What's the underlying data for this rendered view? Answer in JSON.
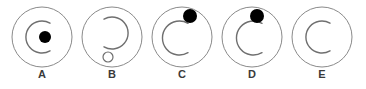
{
  "diagram": {
    "canvas": {
      "width": 366,
      "height": 89,
      "background": "#ffffff"
    },
    "style": {
      "outer_circle_stroke": "#8a8a8a",
      "outer_circle_stroke_width": 1,
      "inner_arc_stroke": "#6f6f6f",
      "inner_arc_stroke_width": 1.4,
      "dot_fill": "#000000",
      "small_circle_fill": "#ffffff",
      "small_circle_stroke": "#6f6f6f",
      "label_color": "#3a3a3a"
    },
    "layout": {
      "outer_diameter": 60,
      "spacing": 70,
      "first_center_x": 42,
      "center_y": 37,
      "label_y": 68
    },
    "figures": [
      {
        "id": "figure-a",
        "label": "A",
        "x": 7,
        "outer_circle": {
          "cx": 35,
          "cy": 37,
          "r": 30
        },
        "inner_arc": {
          "cx": 35,
          "cy": 37,
          "r": 16,
          "opening": "right",
          "path": "M 43 23.2 A 16 16 0 1 0 43 50.8"
        },
        "marker": {
          "type": "filled-dot",
          "cx": 38,
          "cy": 37,
          "r": 6
        }
      },
      {
        "id": "figure-b",
        "label": "B",
        "x": 77,
        "outer_circle": {
          "cx": 35,
          "cy": 37,
          "r": 30
        },
        "inner_arc": {
          "cx": 35,
          "cy": 33,
          "r": 16,
          "opening": "left",
          "path": "M 27 19.2 A 16 16 0 1 1 27 46.8"
        },
        "marker": {
          "type": "open-circle",
          "cx": 31,
          "cy": 57,
          "r": 5
        }
      },
      {
        "id": "figure-c",
        "label": "C",
        "x": 147,
        "outer_circle": {
          "cx": 35,
          "cy": 37,
          "r": 30
        },
        "inner_arc": {
          "cx": 33,
          "cy": 38,
          "r": 17,
          "opening": "right",
          "path": "M 41 23.3 A 17 17 0 1 0 41 52.7"
        },
        "marker": {
          "type": "filled-dot",
          "cx": 43,
          "cy": 16,
          "r": 7
        }
      },
      {
        "id": "figure-d",
        "label": "D",
        "x": 217,
        "outer_circle": {
          "cx": 35,
          "cy": 37,
          "r": 30
        },
        "inner_arc": {
          "cx": 37,
          "cy": 38,
          "r": 17,
          "opening": "right",
          "path": "M 45 23.3 A 17 17 0 1 0 45 52.7"
        },
        "marker": {
          "type": "filled-dot",
          "cx": 40,
          "cy": 16,
          "r": 7
        }
      },
      {
        "id": "figure-e",
        "label": "E",
        "x": 287,
        "outer_circle": {
          "cx": 35,
          "cy": 37,
          "r": 30
        },
        "inner_arc": {
          "cx": 35,
          "cy": 37,
          "r": 16,
          "opening": "right",
          "path": "M 43 23.2 A 16 16 0 1 0 43 50.8"
        },
        "marker": {
          "type": "none"
        }
      }
    ]
  }
}
